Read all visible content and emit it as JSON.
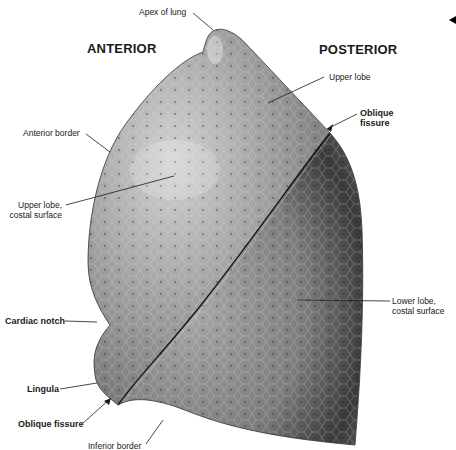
{
  "diagram": {
    "orientation": {
      "left": "ANTERIOR",
      "right": "POSTERIOR"
    },
    "labels": {
      "apex": "Apex of lung",
      "upper_lobe": "Upper lobe",
      "oblique_fissure_top_1": "Oblique",
      "oblique_fissure_top_2": "fissure",
      "anterior_border": "Anterior border",
      "upper_lobe_costal_1": "Upper lobe,",
      "upper_lobe_costal_2": "costal surface",
      "lower_lobe_costal_1": "Lower lobe,",
      "lower_lobe_costal_2": "costal surface",
      "cardiac_notch": "Cardiac notch",
      "lingula": "Lingula",
      "oblique_fissure_bottom": "Oblique fissure",
      "inferior_border": "Inferior border"
    },
    "colors": {
      "background": "#ffffff",
      "lung_light": "#b4b4b4",
      "lung_mid": "#8a8a8a",
      "lung_dark": "#3c3c3c",
      "leader_line": "#1a1a1a"
    }
  }
}
